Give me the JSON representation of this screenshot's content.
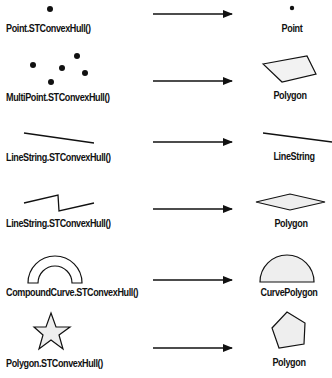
{
  "rows": [
    {
      "left_label": "Point.STConvexHull()",
      "right_label": "Point",
      "left_shape": "point",
      "right_shape": "point"
    },
    {
      "left_label": "MultiPoint.STConvexHull()",
      "right_label": "Polygon",
      "left_shape": "multipoint",
      "right_shape": "quadrilateral-polygon"
    },
    {
      "left_label": "LineString.STConvexHull()",
      "right_label": "LineString",
      "left_shape": "straight-linestring",
      "right_shape": "straight-linestring"
    },
    {
      "left_label": "LineString.STConvexHull()",
      "right_label": "Polygon",
      "left_shape": "zigzag-linestring",
      "right_shape": "diamond-polygon"
    },
    {
      "left_label": "CompoundCurve.STConvexHull()",
      "right_label": "CurvePolygon",
      "left_shape": "arch-compoundcurve",
      "right_shape": "semicircle-curvepolygon"
    },
    {
      "left_label": "Polygon.STConvexHull()",
      "right_label": "Polygon",
      "left_shape": "star-polygon",
      "right_shape": "pentagon-polygon"
    }
  ],
  "colors": {
    "stroke": "#111111",
    "fill": "#eeeeee",
    "background": "#ffffff"
  }
}
